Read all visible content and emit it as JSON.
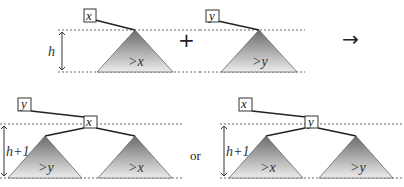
{
  "figure": {
    "top_left": {
      "node": "x",
      "subtree": ">x",
      "height": "h"
    },
    "plus": "+",
    "top_right": {
      "node": "y",
      "subtree": ">y"
    },
    "arrow": "→",
    "bottom_left": {
      "root": "y",
      "child": "x",
      "left_subtree": ">y",
      "right_subtree": ">x",
      "height": "h+1"
    },
    "or": "or",
    "bottom_right": {
      "root": "x",
      "child": "y",
      "left_subtree": ">x",
      "right_subtree": ">y",
      "height": "h+1"
    }
  }
}
